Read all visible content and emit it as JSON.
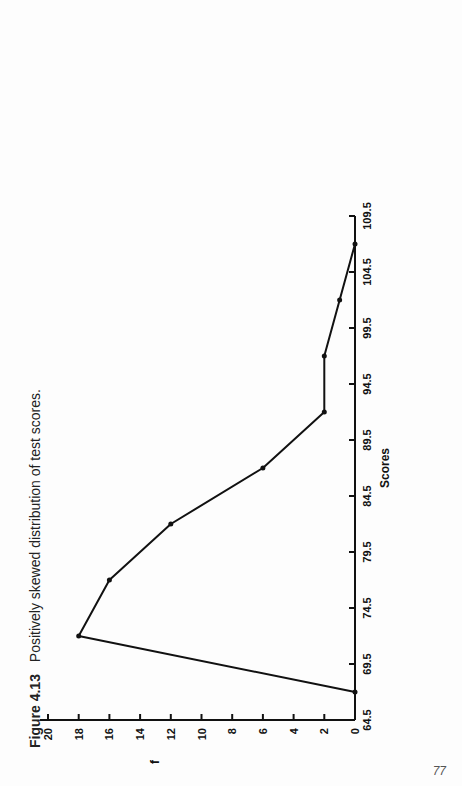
{
  "figure": {
    "caption_label": "Figure 4.13",
    "caption_text": "Positively skewed distribution of test scores.",
    "page_number": "77"
  },
  "chart_data": {
    "type": "line",
    "title": "Positively skewed distribution of test scores.",
    "xlabel": "Scores",
    "ylabel": "f",
    "x_tick_labels": [
      "64.5",
      "69.5",
      "74.5",
      "79.5",
      "84.5",
      "89.5",
      "94.5",
      "99.5",
      "104.5",
      "109.5"
    ],
    "y_tick_labels": [
      "0",
      "2",
      "4",
      "6",
      "8",
      "10",
      "12",
      "14",
      "16",
      "18",
      "20"
    ],
    "xlim": [
      64.5,
      112
    ],
    "ylim": [
      0,
      21
    ],
    "grid": false,
    "x": [
      67,
      72,
      77,
      82,
      87,
      92,
      97,
      102,
      107
    ],
    "values": [
      0,
      18,
      16,
      12,
      6,
      2,
      2,
      1,
      0
    ],
    "series": [
      {
        "name": "frequency polygon",
        "x": [
          67,
          72,
          77,
          82,
          87,
          92,
          97,
          102,
          107
        ],
        "values": [
          0,
          18,
          16,
          12,
          6,
          2,
          2,
          1,
          0
        ]
      }
    ],
    "orientation_note": "page rotated 90 degrees"
  },
  "colors": {
    "line": "#111111",
    "background": "#fdfdfd",
    "caption": "#222222"
  }
}
